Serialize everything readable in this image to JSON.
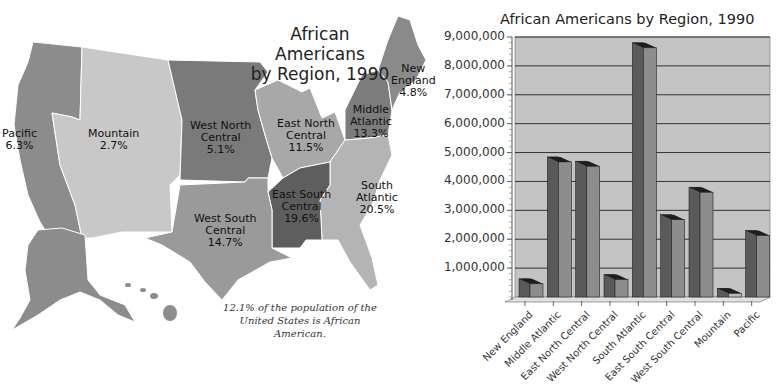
{
  "map": {
    "title_line1": "African Americans",
    "title_line2": "by Region, 1990",
    "caption_line1": "12.1% of the population of the",
    "caption_line2": "United States is African American.",
    "regions": [
      {
        "name_line1": "Pacific",
        "name_line2": "",
        "pct": "6.3%",
        "color": "#8c8c8c"
      },
      {
        "name_line1": "Mountain",
        "name_line2": "",
        "pct": "2.7%",
        "color": "#c8c8c8"
      },
      {
        "name_line1": "West North",
        "name_line2": "Central",
        "pct": "5.1%",
        "color": "#7a7a7a"
      },
      {
        "name_line1": "East North",
        "name_line2": "Central",
        "pct": "11.5%",
        "color": "#a8a8a8"
      },
      {
        "name_line1": "Middle",
        "name_line2": "Atlantic",
        "pct": "13.3%",
        "color": "#7c7c7c"
      },
      {
        "name_line1": "New",
        "name_line2": "England",
        "pct": "4.8%",
        "color": "#8a8a8a"
      },
      {
        "name_line1": "South",
        "name_line2": "Atlantic",
        "pct": "20.5%",
        "color": "#b4b4b4"
      },
      {
        "name_line1": "East South",
        "name_line2": "Central",
        "pct": "19.6%",
        "color": "#5e5e5e"
      },
      {
        "name_line1": "West South",
        "name_line2": "Central",
        "pct": "14.7%",
        "color": "#9a9a9a"
      }
    ]
  },
  "chart_data": {
    "type": "bar",
    "title": "African Americans by Region, 1990",
    "xlabel": "",
    "ylabel": "",
    "ylim": [
      0,
      9000000
    ],
    "grid": true,
    "legend": "none",
    "yticks": [
      "1,000,000",
      "2,000,000",
      "3,000,000",
      "4,000,000",
      "5,000,000",
      "6,000,000",
      "7,000,000",
      "8,000,000",
      "9,000,000"
    ],
    "categories": [
      "New England",
      "Middle Atlantic",
      "East North Central",
      "West North Central",
      "South Atlantic",
      "East South Central",
      "West South Central",
      "Mountain",
      "Pacific"
    ],
    "values": [
      630000,
      4850000,
      4700000,
      780000,
      8800000,
      2850000,
      3800000,
      300000,
      2300000
    ],
    "colors": {
      "bar_front": "#8d8d8d",
      "bar_side": "#5a5a5a",
      "bar_top": "#1e1e1e",
      "plot_bg": "#c4c4c4",
      "gridline": "#333333"
    }
  }
}
